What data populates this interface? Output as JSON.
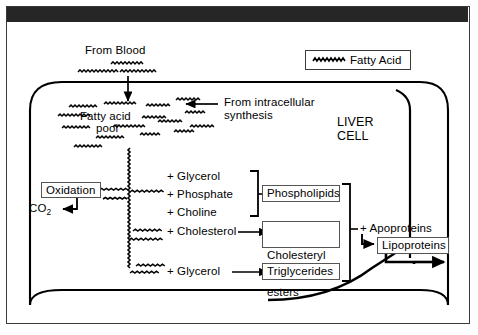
{
  "figure": {
    "cell_label_line1": "LIVER",
    "cell_label_line2": "CELL"
  },
  "legend": {
    "symbol_name": "fatty-acid-squiggle",
    "label": "Fatty Acid"
  },
  "inputs": {
    "from_blood": "From Blood",
    "from_synthesis_line1": "From intracellular",
    "from_synthesis_line2": "synthesis"
  },
  "pool": {
    "line1": "Fatty acid",
    "line2": "pool"
  },
  "oxidation": {
    "box_label": "Oxidation",
    "product": "CO",
    "product_subscript": "2"
  },
  "substrates": {
    "glycerol_a": "+ Glycerol",
    "phosphate": "+ Phosphate",
    "choline": "+ Choline",
    "cholesterol": "+ Cholesterol",
    "glycerol_b": "+ Glycerol"
  },
  "products": {
    "phospholipids": "Phospholipids",
    "cholesteryl_esters_line1": "Cholesteryl",
    "cholesteryl_esters_line2": "esters",
    "triglycerides": "Triglycerides"
  },
  "assembly": {
    "apoproteins": "+ Apoproteins",
    "lipoproteins": "Lipoproteins"
  },
  "colors": {
    "ink": "#000000",
    "frame": "#3a3a3a",
    "header_bar": "#262626",
    "box_stroke": "#555555",
    "background": "#ffffff"
  }
}
